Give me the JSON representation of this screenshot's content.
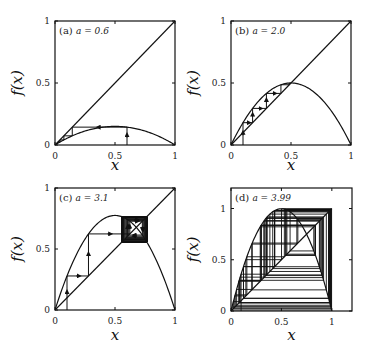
{
  "chart_data": [
    {
      "type": "line",
      "panel": "(a)",
      "title": "(a) a = 0.6",
      "parameter_label": "a = 0.6",
      "a": 0.6,
      "x0": 0.6,
      "iterations": 6,
      "function": "f(x) = a x (1 - x)",
      "xlabel": "x",
      "ylabel": "f(x)",
      "xlim": [
        0,
        1
      ],
      "ylim": [
        0,
        1
      ],
      "xticks": [
        "0",
        "0.5",
        "1"
      ],
      "yticks": [
        "0",
        "0.5",
        "1"
      ],
      "series": [
        {
          "name": "f(x)",
          "kind": "parabola"
        },
        {
          "name": "y = x",
          "kind": "diagonal"
        },
        {
          "name": "cobweb",
          "kind": "cobweb",
          "arrows": true
        }
      ],
      "grid": false
    },
    {
      "type": "line",
      "panel": "(b)",
      "title": "(b) a = 2.0",
      "parameter_label": "a = 2.0",
      "a": 2.0,
      "x0": 0.1,
      "iterations": 6,
      "function": "f(x) = a x (1 - x)",
      "xlabel": "x",
      "ylabel": "f(x)",
      "xlim": [
        0,
        1
      ],
      "ylim": [
        0,
        1
      ],
      "xticks": [
        "0",
        "0.5",
        "1"
      ],
      "yticks": [
        "0",
        "0.5",
        "1"
      ],
      "series": [
        {
          "name": "f(x)",
          "kind": "parabola"
        },
        {
          "name": "y = x",
          "kind": "diagonal"
        },
        {
          "name": "cobweb",
          "kind": "cobweb",
          "arrows": true
        }
      ],
      "grid": false
    },
    {
      "type": "line",
      "panel": "(c)",
      "title": "(c) a = 3.1",
      "parameter_label": "a = 3.1",
      "a": 3.1,
      "x0": 0.1,
      "iterations": 60,
      "function": "f(x) = a x (1 - x)",
      "xlabel": "x",
      "ylabel": "f(x)",
      "xlim": [
        0,
        1
      ],
      "ylim": [
        0,
        1
      ],
      "xticks": [
        "0",
        "0.5",
        "1"
      ],
      "yticks": [
        "0",
        "0.5",
        "1"
      ],
      "series": [
        {
          "name": "f(x)",
          "kind": "parabola"
        },
        {
          "name": "y = x",
          "kind": "diagonal"
        },
        {
          "name": "cobweb",
          "kind": "cobweb",
          "arrows": true
        }
      ],
      "grid": false
    },
    {
      "type": "line",
      "panel": "(d)",
      "title": "(d) a = 3.99",
      "parameter_label": "a = 3.99",
      "a": 3.99,
      "x0": 0.1,
      "iterations": 60,
      "function": "f(x) = a x (1 - x)",
      "xlabel": "x",
      "ylabel": "f(x)",
      "xlim": [
        0,
        1.2
      ],
      "ylim": [
        0,
        1.2
      ],
      "xticks": [
        "0",
        "0.5",
        "1"
      ],
      "yticks": [
        "0",
        "0.5",
        "1"
      ],
      "series": [
        {
          "name": "f(x)",
          "kind": "parabola"
        },
        {
          "name": "y = x",
          "kind": "diagonal"
        },
        {
          "name": "cobweb",
          "kind": "cobweb",
          "arrows": false
        }
      ],
      "grid": false
    }
  ]
}
